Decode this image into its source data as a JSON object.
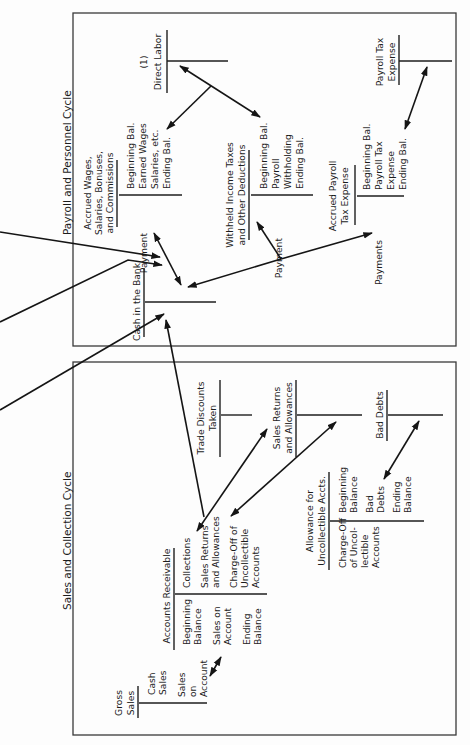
{
  "payroll_cycle": {
    "title": "Payroll and Personnel Cycle",
    "accounts": [
      {
        "id": "direct_labor",
        "title": [
          "(1)",
          "Direct Labor"
        ],
        "debits": [],
        "credits": []
      },
      {
        "id": "accrued_wages",
        "title": [
          "Accrued Wages,",
          "Salaries, Bonuses,",
          "and Commissions"
        ],
        "debits": [
          "Payment"
        ],
        "credits": [
          "Beginning Bal.",
          "Earned Wages",
          "Salaries, etc.",
          "Ending Bal."
        ]
      },
      {
        "id": "withheld_taxes",
        "title": [
          "Withheld Income Taxes",
          "and Other Deductions"
        ],
        "debits": [
          "Payment"
        ],
        "credits": [
          "Beginning Bal.",
          "Payroll",
          "Withholding",
          "Ending Bal."
        ]
      },
      {
        "id": "accrued_payroll_tax",
        "title": [
          "Accrued Payroll",
          "Tax Expense"
        ],
        "debits": [
          "Payments"
        ],
        "credits": [
          "Beginning Bal.",
          "Payroll Tax",
          "Expense",
          "Ending Bal."
        ]
      },
      {
        "id": "payroll_tax_expense",
        "title": [
          "Payroll Tax",
          "Expense"
        ],
        "debits": [],
        "credits": []
      },
      {
        "id": "cash_in_bank",
        "title": [
          "Cash in the Bank"
        ],
        "debits": [],
        "credits": []
      }
    ]
  },
  "sales_cycle": {
    "title": "Sales and Collection Cycle",
    "accounts": [
      {
        "id": "gross_sales",
        "title": [
          "Gross",
          "Sales"
        ],
        "debits": [],
        "credits": [
          "Cash",
          "Sales",
          "Sales",
          "on",
          "Account"
        ]
      },
      {
        "id": "accounts_receivable",
        "title": [
          "Accounts Receivable"
        ],
        "debits": [
          "Beginning",
          "Balance",
          "Sales on",
          "Account",
          "Ending",
          "Balance"
        ],
        "credits": [
          "Collections",
          "Sales Returns",
          "and Allowances",
          "Charge-Off of",
          "Uncollectible",
          "Accounts"
        ]
      },
      {
        "id": "trade_discounts",
        "title": [
          "Trade Discounts",
          "Taken"
        ],
        "debits": [],
        "credits": []
      },
      {
        "id": "sales_returns",
        "title": [
          "Sales Returns",
          "and Allowances"
        ],
        "debits": [],
        "credits": []
      },
      {
        "id": "bad_debts",
        "title": [
          "Bad Debts"
        ],
        "debits": [],
        "credits": []
      },
      {
        "id": "allowance_uncollectible",
        "title": [
          "Allowance for",
          "Uncollectible Accts."
        ],
        "debits": [
          "Charge-Off",
          "of Uncol-",
          "lectible",
          "Accounts"
        ],
        "credits": [
          "Beginning",
          "Balance",
          "Bad",
          "Debts",
          "Ending",
          "Balance"
        ]
      }
    ]
  },
  "colors": {
    "ink": "#1c1c1c",
    "paper": "#fdfdfd",
    "frame": "#3a3a3a"
  },
  "orientation": "rotated 90 degrees counter-clockwise"
}
